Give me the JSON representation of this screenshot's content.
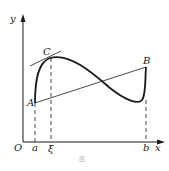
{
  "figure": {
    "axes": {
      "x_label": "x",
      "y_label": "y",
      "origin_label": "O"
    },
    "x_ticks": {
      "a": "a",
      "xi": "ξ",
      "b": "b"
    },
    "points": {
      "A": "A",
      "B": "B",
      "C": "C"
    },
    "caption": "图"
  },
  "colors": {
    "ink": "#1a1a1a",
    "background": "#ffffff"
  }
}
